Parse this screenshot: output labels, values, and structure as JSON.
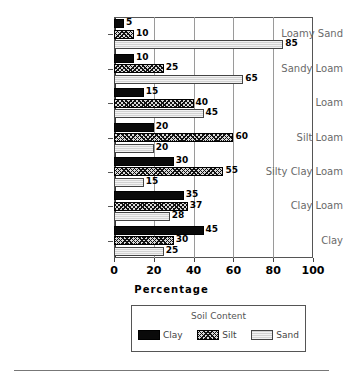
{
  "chart_data": {
    "type": "bar",
    "orientation": "horizontal",
    "title": "",
    "xlabel": "Percentage",
    "ylabel": "",
    "xlim": [
      0,
      100
    ],
    "xticks": [
      0,
      20,
      40,
      60,
      80,
      100
    ],
    "grid": true,
    "legend_position": "bottom",
    "legend_title": "Soil Content",
    "categories": [
      "Loamy Sand",
      "Sandy Loam",
      "Loam",
      "Silt Loam",
      "Silty Clay Loam",
      "Clay Loam",
      "Clay"
    ],
    "series": [
      {
        "name": "Clay",
        "fill": "solid-black",
        "color": "#0a0a0a",
        "values": [
          5,
          10,
          15,
          20,
          30,
          35,
          45
        ]
      },
      {
        "name": "Silt",
        "fill": "cross-hatch",
        "color": "#d8d8d8",
        "values": [
          10,
          25,
          40,
          60,
          55,
          37,
          30
        ]
      },
      {
        "name": "Sand",
        "fill": "light-dotted",
        "color": "#dcdcdc",
        "values": [
          85,
          65,
          45,
          20,
          15,
          28,
          25
        ]
      }
    ]
  },
  "axis": {
    "x_title": "Percentage",
    "tick_labels": [
      "0",
      "20",
      "40",
      "60",
      "80",
      "100"
    ]
  },
  "legend": {
    "title": "Soil Content",
    "entries": [
      {
        "label": "Clay"
      },
      {
        "label": "Silt"
      },
      {
        "label": "Sand"
      }
    ]
  }
}
